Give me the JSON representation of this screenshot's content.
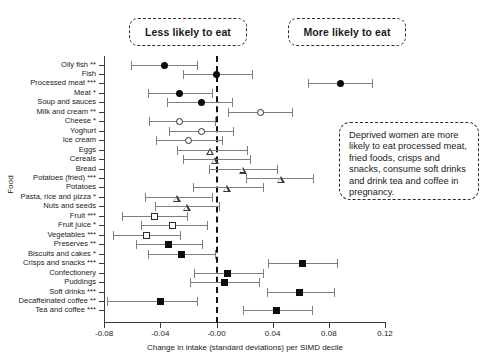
{
  "callouts": {
    "less": "Less likely to eat",
    "more": "More likely to eat",
    "note": "Deprived women are more likely to eat processed meat, fried foods, crisps and snacks, consume soft drinks and drink tea and coffee in pregnancy."
  },
  "chart_data": {
    "type": "scatter",
    "subtype": "forest-plot",
    "title": "",
    "xlabel": "Change in intake (standard deviations) per SIMD decile",
    "ylabel": "Food",
    "xlim": [
      -0.08,
      0.12
    ],
    "xticks": [
      -0.08,
      -0.04,
      -0.0,
      0.04,
      0.08,
      0.12
    ],
    "xticklabels": [
      "-0.08",
      "-0.04",
      "-0.00",
      "0.04",
      "0.08",
      "0.12"
    ],
    "grid": false,
    "legend": "none",
    "reference_line": 0.0,
    "reference_line_style": "dashed",
    "annotations": [
      "Less likely to eat",
      "More likely to eat",
      "Deprived women are more likely to eat processed meat, fried foods, crisps and snacks, consume soft drinks and drink tea and coffee in pregnancy."
    ],
    "categories": [
      "Oily fish **",
      "Fish",
      "Processed meat ***",
      "Meat *",
      "Soup and sauces",
      "Milk and cream **",
      "Cheese *",
      "Yoghurt",
      "Ice cream",
      "Eggs",
      "Cereals",
      "Bread",
      "Potatoes (fried) ***",
      "Potatoes",
      "Pasta, rice and pizza *",
      "Nuts and seeds",
      "Fruit ***",
      "Fruit juice *",
      "Vegetables ***",
      "Preserves **",
      "Biscuits and cakes *",
      "Crisps and snacks ***",
      "Confectionery",
      "Puddings",
      "Soft drinks ***",
      "Decaffeinated coffee **",
      "Tea and coffee ***"
    ],
    "points": [
      {
        "label": "Oily fish **",
        "value": -0.037,
        "ci_low": -0.061,
        "ci_high": -0.014,
        "marker": "circle-filled"
      },
      {
        "label": "Fish",
        "value": 0.0,
        "ci_low": -0.024,
        "ci_high": 0.025,
        "marker": "circle-filled"
      },
      {
        "label": "Processed meat ***",
        "value": 0.088,
        "ci_low": 0.065,
        "ci_high": 0.111,
        "marker": "circle-filled"
      },
      {
        "label": "Meat *",
        "value": -0.026,
        "ci_low": -0.049,
        "ci_high": -0.003,
        "marker": "circle-filled"
      },
      {
        "label": "Soup and sauces",
        "value": -0.011,
        "ci_low": -0.035,
        "ci_high": 0.011,
        "marker": "circle-filled"
      },
      {
        "label": "Milk and cream **",
        "value": 0.031,
        "ci_low": 0.008,
        "ci_high": 0.054,
        "marker": "circle-open"
      },
      {
        "label": "Cheese *",
        "value": -0.026,
        "ci_low": -0.048,
        "ci_high": -0.001,
        "marker": "circle-open"
      },
      {
        "label": "Yoghurt",
        "value": -0.011,
        "ci_low": -0.034,
        "ci_high": 0.012,
        "marker": "circle-open"
      },
      {
        "label": "Ice cream",
        "value": -0.02,
        "ci_low": -0.043,
        "ci_high": 0.004,
        "marker": "circle-open"
      },
      {
        "label": "Eggs",
        "value": -0.004,
        "ci_low": -0.028,
        "ci_high": 0.022,
        "marker": "triangle-open"
      },
      {
        "label": "Cereals",
        "value": -0.001,
        "ci_low": -0.024,
        "ci_high": 0.024,
        "marker": "triangle-open"
      },
      {
        "label": "Bread",
        "value": 0.019,
        "ci_low": -0.005,
        "ci_high": 0.043,
        "marker": "triangle-open"
      },
      {
        "label": "Potatoes (fried) ***",
        "value": 0.046,
        "ci_low": 0.021,
        "ci_high": 0.069,
        "marker": "triangle-open"
      },
      {
        "label": "Potatoes",
        "value": 0.008,
        "ci_low": -0.017,
        "ci_high": 0.033,
        "marker": "triangle-open"
      },
      {
        "label": "Pasta, rice and pizza *",
        "value": -0.028,
        "ci_low": -0.051,
        "ci_high": -0.003,
        "marker": "triangle-open"
      },
      {
        "label": "Nuts and seeds",
        "value": -0.021,
        "ci_low": -0.044,
        "ci_high": 0.002,
        "marker": "triangle-open"
      },
      {
        "label": "Fruit ***",
        "value": -0.044,
        "ci_low": -0.067,
        "ci_high": -0.021,
        "marker": "square-open"
      },
      {
        "label": "Fruit juice *",
        "value": -0.031,
        "ci_low": -0.054,
        "ci_high": -0.007,
        "marker": "square-open"
      },
      {
        "label": "Vegetables ***",
        "value": -0.05,
        "ci_low": -0.074,
        "ci_high": -0.026,
        "marker": "square-open"
      },
      {
        "label": "Preserves **",
        "value": -0.034,
        "ci_low": -0.057,
        "ci_high": -0.01,
        "marker": "square-filled"
      },
      {
        "label": "Biscuits and cakes *",
        "value": -0.025,
        "ci_low": -0.049,
        "ci_high": -0.001,
        "marker": "square-filled"
      },
      {
        "label": "Crisps and snacks ***",
        "value": 0.061,
        "ci_low": 0.037,
        "ci_high": 0.086,
        "marker": "square-filled"
      },
      {
        "label": "Confectionery",
        "value": 0.008,
        "ci_low": -0.016,
        "ci_high": 0.033,
        "marker": "square-filled"
      },
      {
        "label": "Puddings",
        "value": 0.006,
        "ci_low": -0.019,
        "ci_high": 0.03,
        "marker": "square-filled"
      },
      {
        "label": "Soft drinks ***",
        "value": 0.059,
        "ci_low": 0.036,
        "ci_high": 0.084,
        "marker": "square-filled"
      },
      {
        "label": "Decaffeinated coffee **",
        "value": -0.04,
        "ci_low": -0.078,
        "ci_high": -0.014,
        "marker": "square-filled"
      },
      {
        "label": "Tea and coffee ***",
        "value": 0.043,
        "ci_low": 0.019,
        "ci_high": 0.068,
        "marker": "square-filled"
      }
    ]
  }
}
